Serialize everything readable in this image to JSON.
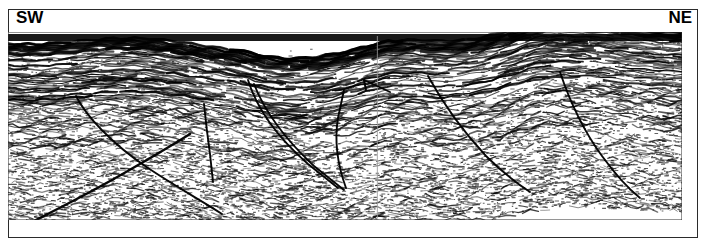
{
  "figure": {
    "type": "seismic-reflection-profile",
    "orientation": {
      "left_label": "SW",
      "right_label": "NE"
    },
    "frame": {
      "border_color": "#2b2b2b",
      "background_color": "#ffffff"
    },
    "seismic": {
      "ink_color": "#000000",
      "paper_color": "#ffffff",
      "panel_seam_x_fraction": 0.548,
      "bands": [
        {
          "name": "top-dark-reflector-band",
          "y_fraction": 0.02,
          "thickness_fraction": 0.055,
          "darkness": "very-dark"
        },
        {
          "name": "upper-layered-reflectors",
          "y_fraction": 0.08,
          "thickness_fraction": 0.22,
          "darkness": "dark"
        },
        {
          "name": "middle-reflectors",
          "y_fraction": 0.3,
          "thickness_fraction": 0.28,
          "darkness": "medium"
        },
        {
          "name": "lower-noise-zone",
          "y_fraction": 0.58,
          "thickness_fraction": 0.42,
          "darkness": "speckled"
        }
      ],
      "faults": [
        {
          "name": "fault-sw-listric",
          "label": "",
          "style": "curved-normal-fault",
          "dip": "NE"
        },
        {
          "name": "fault-sw-antithetic",
          "label": "",
          "style": "planar-normal-fault",
          "dip": "SW"
        },
        {
          "name": "fault-graben-west",
          "label": "",
          "style": "curved-normal-fault",
          "dip": "NE"
        },
        {
          "name": "fault-graben-east",
          "label": "",
          "style": "planar-normal-fault",
          "dip": "SW"
        },
        {
          "name": "fault-center-short",
          "label": "",
          "style": "planar-normal-fault",
          "dip": "NE"
        },
        {
          "name": "fault-ne-listric-1",
          "label": "",
          "style": "curved-normal-fault",
          "dip": "SW"
        },
        {
          "name": "fault-ne-listric-2",
          "label": "",
          "style": "curved-normal-fault",
          "dip": "SW"
        },
        {
          "name": "fault-basal-sw",
          "label": "",
          "style": "planar-normal-fault",
          "dip": "NE"
        }
      ]
    }
  }
}
